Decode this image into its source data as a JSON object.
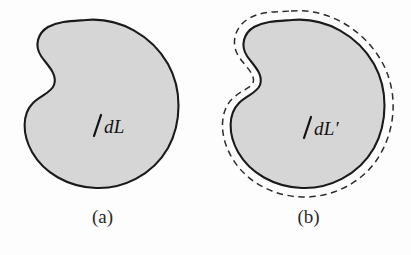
{
  "figure": {
    "background_color": "#fdfdfd",
    "shape_fill_color": "#d6d6d6",
    "shape_stroke_color": "#1a1a1a",
    "dashed_stroke_color": "#2b2b2b",
    "panels": [
      {
        "id": "a",
        "caption": "(a)",
        "label": "dL",
        "has_dashed_contour": false
      },
      {
        "id": "b",
        "caption": "(b)",
        "label": "dL′",
        "has_dashed_contour": true
      }
    ]
  }
}
